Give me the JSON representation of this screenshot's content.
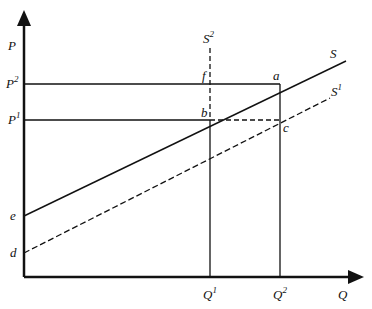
{
  "diagram": {
    "axes": {
      "y_label": "P",
      "x_label": "Q"
    },
    "prices": {
      "p1": "P",
      "p1_sup": "1",
      "p2": "P",
      "p2_sup": "2"
    },
    "quantities": {
      "q1": "Q",
      "q1_sup": "1",
      "q2": "Q",
      "q2_sup": "2"
    },
    "curves": {
      "s": "S",
      "s1": "S",
      "s1_sup": "1",
      "s2": "S",
      "s2_sup": "2"
    },
    "points": {
      "a": "a",
      "b": "b",
      "c": "c",
      "d": "d",
      "e": "e",
      "f": "f"
    }
  }
}
